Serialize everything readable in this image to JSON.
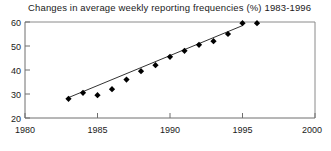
{
  "chart_data": {
    "type": "scatter",
    "title": "Changes in average weekly reporting frequencies (%) 1983-1996",
    "xlabel": "",
    "ylabel": "",
    "xlim": [
      1980,
      2000
    ],
    "ylim": [
      20,
      60
    ],
    "xticks": [
      1980,
      1985,
      1990,
      1995,
      2000
    ],
    "yticks": [
      20,
      30,
      40,
      50,
      60
    ],
    "xtick_labels": [
      "1980",
      "1985",
      "1990",
      "1995",
      "2000"
    ],
    "ytick_labels": [
      "20",
      "30",
      "40",
      "50",
      "60"
    ],
    "grid": false,
    "legend": "none",
    "marker": "diamond",
    "marker_color": "#000000",
    "line_color": "#333333",
    "axis_color": "#777777",
    "x": [
      1983,
      1984,
      1985,
      1986,
      1987,
      1988,
      1989,
      1990,
      1991,
      1992,
      1993,
      1994,
      1995,
      1996
    ],
    "values": [
      28,
      30.5,
      29.5,
      32,
      36,
      39.5,
      42,
      45.5,
      48,
      50.5,
      52,
      55,
      59.5,
      59.5
    ],
    "series": [
      {
        "name": "Reporting frequency",
        "x": [
          1983,
          1984,
          1985,
          1986,
          1987,
          1988,
          1989,
          1990,
          1991,
          1992,
          1993,
          1994,
          1995,
          1996
        ],
        "values": [
          28,
          30.5,
          29.5,
          32,
          36,
          39.5,
          42,
          45.5,
          48,
          50.5,
          52,
          55,
          59.5,
          59.5
        ]
      },
      {
        "name": "Linear trend line",
        "type": "line",
        "x": [
          1983,
          1995
        ],
        "values": [
          28.5,
          58.5
        ]
      }
    ],
    "annotations": []
  }
}
